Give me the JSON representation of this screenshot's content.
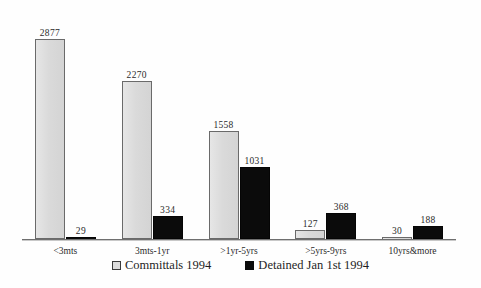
{
  "chart_data": {
    "type": "bar",
    "title": "",
    "xlabel": "",
    "ylabel": "",
    "ylim": [
      0,
      2877
    ],
    "grid": false,
    "legend_position": "bottom",
    "categories": [
      "<3mts",
      "3mts-1yr",
      ">1yr-5yrs",
      ">5yrs-9yrs",
      "10yrs&more"
    ],
    "series": [
      {
        "name": "Committals 1994",
        "color": "#dcdcdc",
        "values": [
          2877,
          2270,
          1558,
          127,
          30
        ]
      },
      {
        "name": "Detained Jan 1st 1994",
        "color": "#0b0b0b",
        "values": [
          29,
          334,
          1031,
          368,
          188
        ]
      }
    ],
    "data_labels": [
      [
        "2877",
        "29"
      ],
      [
        "2270",
        "334"
      ],
      [
        "1558",
        "1031"
      ],
      [
        "127",
        "368"
      ],
      [
        "30",
        "188"
      ]
    ]
  },
  "legend": {
    "items": [
      {
        "label": "Committals 1994",
        "swatch": "light-square-swatch"
      },
      {
        "label": "Detained Jan 1st 1994",
        "swatch": "dark-square-swatch"
      }
    ]
  },
  "axis": {
    "tick_labels": [
      "<3mts",
      "3mts-1yr",
      ">1yr-5yrs",
      ">5yrs-9yrs",
      "10yrs&more"
    ]
  }
}
